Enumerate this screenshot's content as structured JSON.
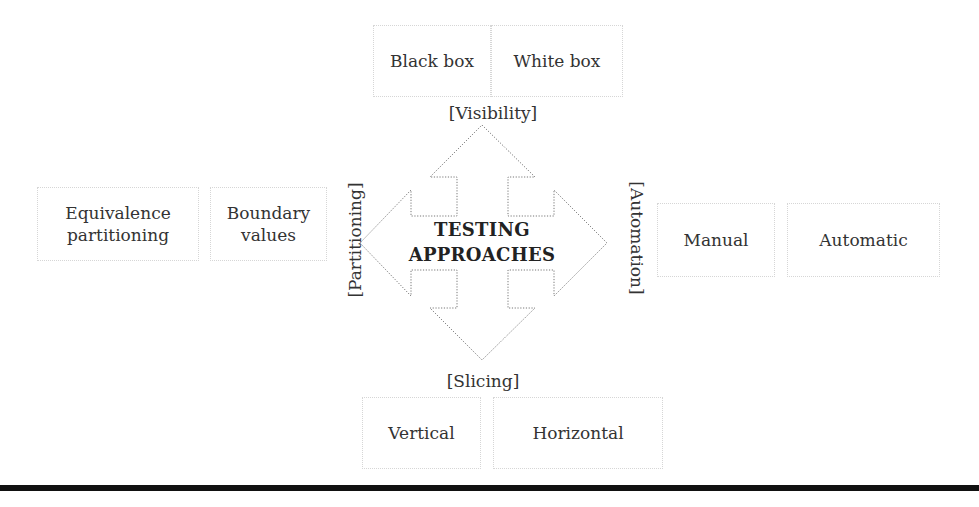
{
  "diagram": {
    "center": {
      "line1": "TESTING",
      "line2": "APPROACHES"
    },
    "axes": {
      "visibility": {
        "label": "[Visibility]",
        "direction": "up",
        "items": [
          "Black box",
          "White box"
        ]
      },
      "slicing": {
        "label": "[Slicing]",
        "direction": "down",
        "items": [
          "Vertical",
          "Horizontal"
        ]
      },
      "partitioning": {
        "label": "[Partitioning]",
        "direction": "left",
        "items": [
          "Equivalence partitioning",
          "Boundary values"
        ]
      },
      "automation": {
        "label": "[Automation]",
        "direction": "right",
        "items": [
          "Manual",
          "Automatic"
        ]
      }
    },
    "colors": {
      "arrow_stroke": "#777777",
      "box_border": "#d6d6d6",
      "text": "#333333",
      "rule": "#111111"
    },
    "arrow_shape": "four-way-arrow"
  }
}
